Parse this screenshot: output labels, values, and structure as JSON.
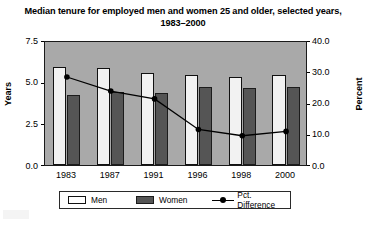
{
  "chart_data": {
    "type": "bar",
    "title": "Median tenure for employed men and women 25 and older, selected years, 1983–2000",
    "xlabel": "",
    "ylabel": "Years",
    "ylabel_secondary": "Percent",
    "categories": [
      "1983",
      "1987",
      "1991",
      "1996",
      "1998",
      "2000"
    ],
    "series": [
      {
        "name": "Men",
        "axis": "left",
        "values": [
          5.9,
          5.8,
          5.5,
          5.4,
          5.3,
          5.4
        ]
      },
      {
        "name": "Women",
        "axis": "left",
        "values": [
          4.2,
          4.4,
          4.3,
          4.7,
          4.6,
          4.7
        ]
      },
      {
        "name": "Pct. Difference",
        "axis": "right",
        "values": [
          28.8,
          24.3,
          21.8,
          12.0,
          10.0,
          11.4
        ]
      }
    ],
    "ylim": [
      0.0,
      7.5
    ],
    "yticks": [
      "0.0",
      "2.5",
      "5.0",
      "7.5"
    ],
    "ylim_secondary": [
      0.0,
      40.0
    ],
    "yticks_secondary": [
      "0.0",
      "10.0",
      "20.0",
      "30.0",
      "40.0"
    ],
    "grid": false,
    "legend_position": "bottom",
    "plot_background": "#a9a9a9",
    "colors": {
      "men_bar": "#f2f2f2",
      "women_bar": "#555555",
      "line": "#000000"
    }
  },
  "legend": {
    "entries": [
      {
        "label": "Men"
      },
      {
        "label": "Women"
      },
      {
        "label": "Pct. Difference"
      }
    ]
  }
}
